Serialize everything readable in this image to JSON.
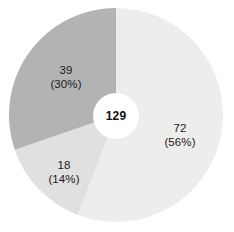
{
  "chart_data": {
    "type": "pie",
    "title": "",
    "subtitle": "",
    "xlabel": "",
    "ylabel": "",
    "grid": false,
    "legend": "none",
    "donut": true,
    "inner_radius_ratio": 0.215,
    "start_angle_deg": 0,
    "direction": "clockwise",
    "center_label": "129",
    "total": 129,
    "categories": [
      "72",
      "18",
      "39"
    ],
    "values": [
      72,
      18,
      39
    ],
    "percentages": [
      56,
      14,
      30
    ],
    "colors": [
      "#ededed",
      "#e0e0e0",
      "#b3b3b3"
    ],
    "slices": [
      {
        "value": 72,
        "percent": 56,
        "value_label": "72",
        "percent_label": "(56%)",
        "color": "#ededed",
        "start_deg": 0,
        "sweep_deg": 200.9
      },
      {
        "value": 18,
        "percent": 14,
        "value_label": "18",
        "percent_label": "(14%)",
        "color": "#e0e0e0",
        "start_deg": 200.9,
        "sweep_deg": 50.2
      },
      {
        "value": 39,
        "percent": 30,
        "value_label": "39",
        "percent_label": "(30%)",
        "color": "#b3b3b3",
        "start_deg": 251.1,
        "sweep_deg": 108.9
      }
    ]
  },
  "figure": {
    "background": "#ffffff",
    "center_x": 116,
    "center_y": 115,
    "radius": 107,
    "inner_radius": 23,
    "hole_color": "#ffffff"
  }
}
